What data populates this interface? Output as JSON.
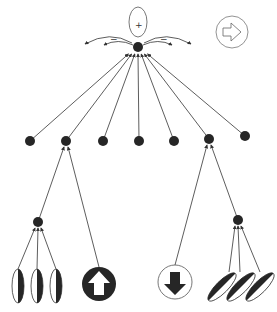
{
  "diagram": {
    "title": "",
    "top_node": {
      "label": "",
      "field_sign_top": "+",
      "field_sign_left": "−",
      "field_sign_right": "−"
    },
    "direction_icon": {
      "icon": "arrow-right-icon"
    },
    "middle_layer": {
      "count": 7
    },
    "left_group": {
      "hub": "left-hub",
      "inputs": [
        "vertical-ellipse-1",
        "vertical-ellipse-2",
        "vertical-ellipse-3"
      ],
      "input_icon": "arrow-up-icon",
      "input_icon_style": "filled"
    },
    "right_group": {
      "hub": "right-hub",
      "inputs": [
        "tilted-ellipse-1",
        "tilted-ellipse-2",
        "tilted-ellipse-3"
      ],
      "input_icon": "arrow-down-icon",
      "input_icon_style": "outlined"
    },
    "colors": {
      "ink": "#262626",
      "line": "#333333",
      "background": "#ffffff"
    }
  }
}
